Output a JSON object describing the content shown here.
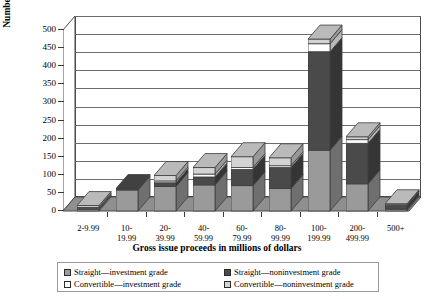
{
  "chart_data": {
    "type": "bar",
    "subtype": "stacked-3d-column",
    "title": "",
    "xlabel": "Gross issue proceeds in millions of dollars",
    "ylabel": "Number of issues",
    "ylim": [
      0,
      500
    ],
    "ytick_step": 50,
    "yticks": [
      "0",
      "50",
      "100",
      "150",
      "200",
      "250",
      "300",
      "350",
      "400",
      "450",
      "500"
    ],
    "grid": true,
    "legend_position": "bottom",
    "categories": [
      "2-9.99",
      "10-19.99",
      "20-39.99",
      "40-59.99",
      "60-79.99",
      "80-99.99",
      "100-199.99",
      "200-499.99",
      "500+"
    ],
    "category_lines": [
      [
        "2-9.99"
      ],
      [
        "10-",
        "19.99"
      ],
      [
        "20-",
        "39.99"
      ],
      [
        "40-",
        "59.99"
      ],
      [
        "60-",
        "79.99"
      ],
      [
        "80-",
        "99.99"
      ],
      [
        "100-",
        "199.99"
      ],
      [
        "200-",
        "499.99"
      ],
      [
        "500+"
      ]
    ],
    "series": [
      {
        "name": "Straight—investment grade",
        "color": "#9a9a9a",
        "values": [
          5,
          58,
          68,
          72,
          70,
          62,
          168,
          75,
          5
        ]
      },
      {
        "name": "Straight—noninvestment grade",
        "color": "#4a4a4a",
        "values": [
          2,
          4,
          10,
          22,
          45,
          58,
          272,
          112,
          10
        ]
      },
      {
        "name": "Convertible—investment grade",
        "color": "#ffffff",
        "values": [
          3,
          0,
          5,
          8,
          5,
          5,
          22,
          10,
          2
        ]
      },
      {
        "name": "Convertible—noninvestment grade",
        "color": "#d3d3d3",
        "values": [
          5,
          0,
          15,
          18,
          30,
          22,
          13,
          8,
          3
        ]
      }
    ],
    "totals": [
      15,
      62,
      98,
      120,
      150,
      147,
      475,
      205,
      20
    ]
  },
  "legend": {
    "items": [
      {
        "label": "Straight—investment grade",
        "color": "#9a9a9a"
      },
      {
        "label": "Straight—noninvestment grade",
        "color": "#4a4a4a"
      },
      {
        "label": "Convertible—investment grade",
        "color": "#ffffff"
      },
      {
        "label": "Convertible—noninvestment grade",
        "color": "#d3d3d3"
      }
    ]
  }
}
